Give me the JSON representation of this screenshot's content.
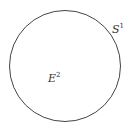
{
  "diagram": {
    "circle": {
      "cx": 65,
      "cy": 66,
      "r": 55.5,
      "stroke": "#444444"
    },
    "labels": {
      "boundary": {
        "base": "S",
        "sup": "1"
      },
      "interior": {
        "base": "E",
        "sup": "2"
      }
    }
  }
}
